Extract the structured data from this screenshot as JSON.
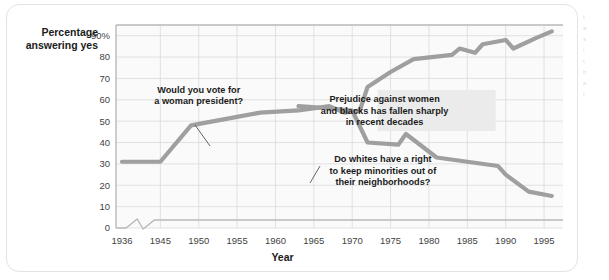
{
  "figure": {
    "plot_bg_color": "#fafafa",
    "grid_color": "#d7d7d7",
    "line_color": "#9f9f9f",
    "annotation_box_color": "#ebebeb",
    "text_color": "#1b1b1b"
  },
  "axes": {
    "y_title_line1": "Percentage",
    "y_title_line2": "answering yes",
    "x_title": "Year",
    "y_ticks": [
      "90%",
      "80",
      "70",
      "60",
      "50",
      "40",
      "30",
      "20",
      "10",
      "0"
    ],
    "x_ticks": [
      "1936",
      "1945",
      "1950",
      "1955",
      "1960",
      "1965",
      "1970",
      "1975",
      "1980",
      "1985",
      "1990",
      "1995"
    ],
    "x_axis_has_break": true
  },
  "annotations": [
    {
      "id": "woman-president",
      "lines": [
        "Would you vote for",
        "a woman president?"
      ],
      "boxed": false
    },
    {
      "id": "prejudice-fallen",
      "lines": [
        "Prejudice against women",
        "and blacks has fallen sharply",
        "in recent decades"
      ],
      "boxed": true
    },
    {
      "id": "whites-right",
      "lines": [
        "Do whites have a right",
        "to keep minorities out of",
        "their neighborhoods?"
      ],
      "boxed": false
    }
  ],
  "page_edge": {
    "line1": "t",
    "line2": "a",
    "line3": "s",
    "line4": "i",
    "line5": "t",
    "line6": "h",
    "line7": "e",
    "line8": "r"
  },
  "chart_data": {
    "type": "line",
    "title": "",
    "xlabel": "Year",
    "ylabel": "Percentage answering yes",
    "xlim": [
      1936,
      1996
    ],
    "ylim": [
      0,
      95
    ],
    "grid": true,
    "legend": "none",
    "x_tick_values": [
      1936,
      1945,
      1950,
      1955,
      1960,
      1965,
      1970,
      1975,
      1980,
      1985,
      1990,
      1995
    ],
    "y_tick_values": [
      0,
      10,
      20,
      30,
      40,
      50,
      60,
      70,
      80,
      90
    ],
    "axis_break_between": [
      1936,
      1945
    ],
    "series": [
      {
        "name": "Would you vote for a woman president?",
        "color": "#9f9f9f",
        "x": [
          1936,
          1945,
          1949,
          1955,
          1958,
          1963,
          1967,
          1969,
          1971,
          1972,
          1975,
          1978,
          1983,
          1984,
          1986,
          1987,
          1990,
          1991,
          1994,
          1996
        ],
        "y": [
          31,
          31,
          48,
          52,
          54,
          55,
          57,
          54,
          55,
          66,
          73,
          79,
          81,
          84,
          82,
          86,
          88,
          84,
          89,
          92
        ]
      },
      {
        "name": "Do whites have a right to keep minorities out of their neighborhoods?",
        "color": "#9f9f9f",
        "x": [
          1963,
          1967,
          1970,
          1972,
          1976,
          1977,
          1981,
          1985,
          1989,
          1990,
          1993,
          1996
        ],
        "y": [
          57,
          56,
          55,
          40,
          39,
          44,
          33,
          31,
          29,
          25,
          17,
          15
        ]
      }
    ],
    "annotations": [
      {
        "text": "Would you vote for a woman president?",
        "x": 1950,
        "y": 62
      },
      {
        "text": "Prejudice against women and blacks has fallen sharply in recent decades",
        "x": 1981,
        "y": 55
      },
      {
        "text": "Do whites have a right to keep minorities out of their neighborhoods?",
        "x": 1974,
        "y": 27
      }
    ]
  }
}
